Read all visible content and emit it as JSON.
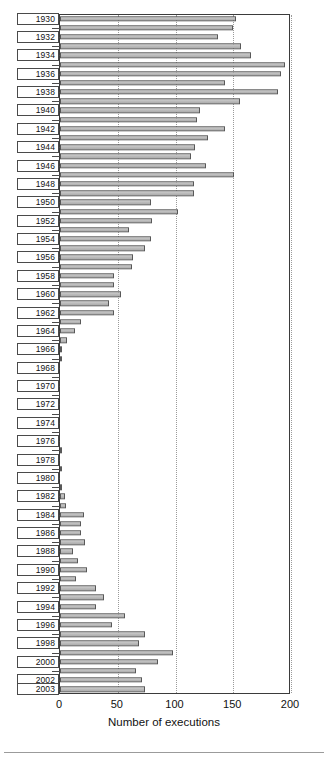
{
  "chart_data": {
    "type": "bar",
    "orientation": "horizontal",
    "title": "",
    "xlabel": "Number of executions",
    "ylabel": "",
    "xlim": [
      0,
      200
    ],
    "xticks": [
      0,
      50,
      100,
      150,
      200
    ],
    "xtick_labels": [
      "0",
      "50",
      "100",
      "150",
      "200"
    ],
    "grid": "vertical-dotted",
    "legend": "none",
    "ytick_labels_every": 2,
    "categories": [
      "1930",
      "1931",
      "1932",
      "1933",
      "1934",
      "1935",
      "1936",
      "1937",
      "1938",
      "1939",
      "1940",
      "1941",
      "1942",
      "1943",
      "1944",
      "1945",
      "1946",
      "1947",
      "1948",
      "1949",
      "1950",
      "1951",
      "1952",
      "1953",
      "1954",
      "1955",
      "1956",
      "1957",
      "1958",
      "1959",
      "1960",
      "1961",
      "1962",
      "1963",
      "1964",
      "1965",
      "1966",
      "1967",
      "1968",
      "1969",
      "1970",
      "1971",
      "1972",
      "1973",
      "1974",
      "1975",
      "1976",
      "1977",
      "1978",
      "1979",
      "1980",
      "1981",
      "1982",
      "1983",
      "1984",
      "1985",
      "1986",
      "1987",
      "1988",
      "1989",
      "1990",
      "1991",
      "1992",
      "1993",
      "1994",
      "1995",
      "1996",
      "1997",
      "1998",
      "1999",
      "2000",
      "2001",
      "2002",
      "2003"
    ],
    "visible_tick_labels": [
      "1930",
      "1932",
      "1934",
      "1936",
      "1938",
      "1940",
      "1942",
      "1944",
      "1946",
      "1948",
      "1950",
      "1952",
      "1954",
      "1956",
      "1958",
      "1960",
      "1962",
      "1964",
      "1966",
      "1968",
      "1970",
      "1972",
      "1974",
      "1976",
      "1978",
      "1980",
      "1982",
      "1984",
      "1986",
      "1988",
      "1990",
      "1992",
      "1994",
      "1996",
      "1998",
      "2000",
      "2002",
      "2003"
    ],
    "values": [
      152,
      150,
      137,
      157,
      165,
      195,
      191,
      143,
      189,
      156,
      121,
      119,
      143,
      128,
      117,
      113,
      126,
      151,
      116,
      116,
      79,
      102,
      80,
      60,
      79,
      74,
      63,
      62,
      47,
      47,
      53,
      42,
      47,
      18,
      13,
      6,
      2,
      2,
      0,
      0,
      0,
      0,
      0,
      0,
      0,
      0,
      0,
      1,
      0,
      2,
      0,
      1,
      4,
      5,
      21,
      18,
      18,
      22,
      11,
      16,
      23,
      14,
      31,
      38,
      31,
      56,
      45,
      74,
      68,
      98,
      85,
      66,
      71,
      74
    ],
    "colors": {
      "bar_fill": "#bdbdbd",
      "bar_edge": "#585858",
      "grid": "#9a9a9a",
      "frame": "#3b3b3b",
      "text": "#111111",
      "background": "#ffffff"
    }
  }
}
